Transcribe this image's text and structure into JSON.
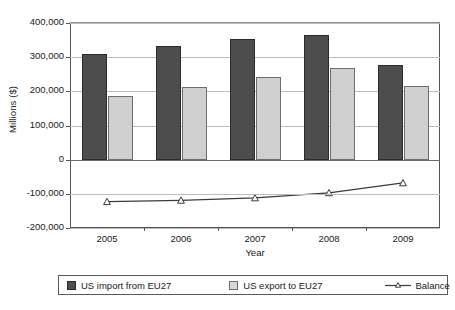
{
  "chart_data": {
    "type": "bar",
    "title": "",
    "subtitle": "",
    "xlabel": "Year",
    "ylabel": "Millions ($)",
    "categories": [
      "2005",
      "2006",
      "2007",
      "2008",
      "2009"
    ],
    "series": [
      {
        "name": "US import from EU27",
        "type": "bar",
        "color": "#4d4d4d",
        "values": [
          308000,
          333000,
          353000,
          365000,
          277000
        ]
      },
      {
        "name": "US export to EU27",
        "type": "bar",
        "color": "#cfcfcf",
        "values": [
          185000,
          212000,
          242000,
          268000,
          215000
        ]
      },
      {
        "name": "Balance",
        "type": "line",
        "color": "#3b3b3b",
        "marker": "triangle",
        "values": [
          -123000,
          -119000,
          -112000,
          -97000,
          -68000
        ]
      }
    ],
    "ylim": [
      -200000,
      400000
    ],
    "yticks": [
      400000,
      300000,
      200000,
      100000,
      0,
      -100000,
      -200000
    ],
    "ytick_labels": [
      "400,000",
      "300,000",
      "200,000",
      "100,000",
      "0",
      "-100,000",
      "-200,000"
    ],
    "grid": true,
    "legend_position": "bottom"
  },
  "legend": {
    "import_label": "US import from EU27",
    "export_label": "US export to EU27",
    "balance_label": "Balance"
  }
}
